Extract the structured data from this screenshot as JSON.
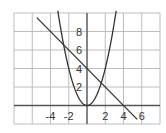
{
  "chart_data": {
    "type": "line",
    "title": "",
    "xlabel": "",
    "ylabel": "",
    "xlim": [
      -8,
      8
    ],
    "ylim": [
      -2,
      10
    ],
    "grid": true,
    "grid_step": 2,
    "x_tick_labels": [
      "-4",
      "-2",
      "2",
      "4",
      "6"
    ],
    "x_ticks": [
      -4,
      -2,
      2,
      4,
      6
    ],
    "y_tick_labels": [
      "2",
      "4",
      "6",
      "8"
    ],
    "y_ticks": [
      2,
      4,
      6,
      8
    ],
    "series": [
      {
        "name": "parabola",
        "equation": "y = x^2",
        "x": [
          -3.2,
          -3,
          -2,
          -1,
          0,
          1,
          2,
          3,
          3.2
        ],
        "y": [
          10.24,
          9,
          4,
          1,
          0,
          1,
          4,
          9,
          10.24
        ]
      },
      {
        "name": "line",
        "equation": "y = -x + 4",
        "x": [
          -5.5,
          5.5
        ],
        "y": [
          9.5,
          -1.5
        ]
      }
    ],
    "intersections": [
      [
        -2.56,
        6.56
      ],
      [
        1.56,
        2.44
      ]
    ]
  },
  "colors": {
    "grid": "#bdbdbd",
    "axis": "#555555",
    "curve": "#333333"
  }
}
